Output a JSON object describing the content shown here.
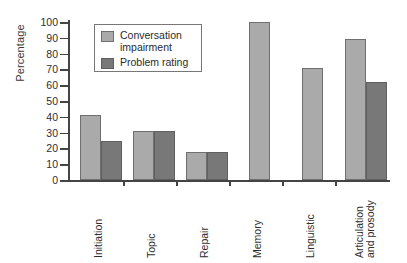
{
  "chart_data": {
    "type": "bar",
    "title": "",
    "xlabel": "",
    "ylabel": "Percentage",
    "ylim": [
      0,
      100
    ],
    "ytick_values": [
      0,
      10,
      20,
      30,
      40,
      50,
      60,
      70,
      80,
      90,
      100
    ],
    "ytick_labels": [
      "0",
      "10",
      "20",
      "30",
      "40",
      "50",
      "60",
      "70",
      "80",
      "90",
      "100"
    ],
    "grid": false,
    "legend_position": "top-left-inside",
    "categories": [
      "Initiation",
      "Topic",
      "Repair",
      "Memory",
      "Linguistic",
      "Articulation and prosody"
    ],
    "category_labels": [
      {
        "line1": "Initiation",
        "line2": ""
      },
      {
        "line1": "Topic",
        "line2": ""
      },
      {
        "line1": "Repair",
        "line2": ""
      },
      {
        "line1": "Memory",
        "line2": ""
      },
      {
        "line1": "Linguistic",
        "line2": ""
      },
      {
        "line1": "Articulation",
        "line2": "and prosody"
      }
    ],
    "series": [
      {
        "name": "Conversation impairment",
        "color": "#aaaaaa",
        "values": [
          41,
          31,
          18,
          100,
          71,
          89
        ]
      },
      {
        "name": "Problem rating",
        "color": "#787878",
        "values": [
          25,
          31,
          18,
          null,
          null,
          62
        ]
      }
    ]
  },
  "legend": {
    "items": [
      {
        "label_line1": "Conversation",
        "label_line2": "impairment",
        "swatch": "light"
      },
      {
        "label_line1": "Problem rating",
        "label_line2": "",
        "swatch": "dark"
      }
    ]
  },
  "colors": {
    "series_light": "#aaaaaa",
    "series_dark": "#787878",
    "axis": "#444444",
    "text": "#2e2e2e",
    "background": "#ffffff"
  }
}
